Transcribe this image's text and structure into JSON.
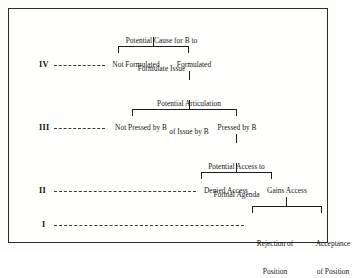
{
  "figure": {
    "title": "Potential Cause for B to Formulate Issue",
    "type": "decision-tree-diagram",
    "frame_color": "#2b2b2b",
    "line_color": "#1c1c1c",
    "text_color": "#161616"
  },
  "levels": [
    {
      "id": "level-iv",
      "numeral": "IV"
    },
    {
      "id": "level-iii",
      "numeral": "III"
    },
    {
      "id": "level-ii",
      "numeral": "II"
    },
    {
      "id": "level-i",
      "numeral": "I"
    }
  ],
  "nodes": {
    "root": {
      "line1": "Potential Cause for B to",
      "line2": "Formulate Issue"
    },
    "not_formulated": "Not Formulated",
    "formulated": "Formulated",
    "potential_articulation": {
      "line1": "Potential Articulation",
      "line2": "of Issue by B"
    },
    "not_pressed": "Not Pressed by B",
    "pressed": "Pressed by B",
    "potential_access": {
      "line1": "Potential Access to",
      "line2": "Formal Agenda"
    },
    "denied_access": "Denied Access",
    "gains_access": "Gains Access",
    "rejection": {
      "line1": "Rejection of",
      "line2": "Position"
    },
    "acceptance": {
      "line1": "Acceptance",
      "line2": "of Position"
    }
  }
}
